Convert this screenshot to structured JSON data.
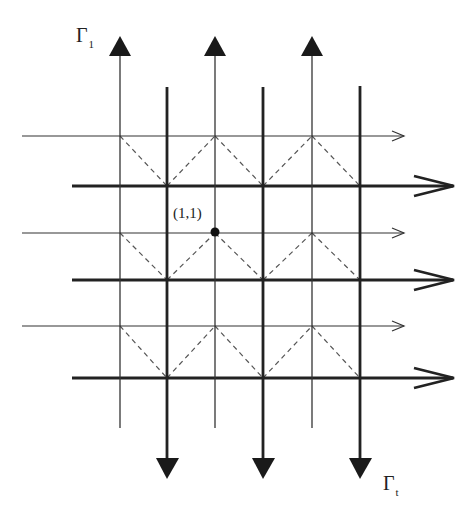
{
  "diagram": {
    "title": "",
    "labels": {
      "gamma_top": {
        "symbol": "Γ",
        "subscript": "1"
      },
      "gamma_bottom": {
        "symbol": "Γ",
        "subscript": "t"
      },
      "point": "(1,1)"
    },
    "colors": {
      "line": "#2a2a2a",
      "dashed": "#555555",
      "background": "#ffffff"
    },
    "thin_vertical_lines_x": [
      120,
      215,
      312
    ],
    "thick_vertical_lines_x": [
      167,
      263,
      360
    ],
    "thin_horizontal_lines_y": [
      136,
      233,
      326
    ],
    "thick_horizontal_lines_y": [
      186,
      280,
      378
    ],
    "thin_vertical_direction": "up",
    "thick_vertical_direction": "down",
    "horizontal_direction": "right",
    "highlighted_point": {
      "x": 215,
      "y": 233,
      "label": "(1,1)"
    },
    "dashed_pattern": "zigzag diagonals connecting thin-line intersections to thick-line intersections"
  }
}
